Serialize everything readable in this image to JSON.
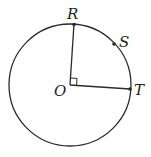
{
  "diagram": {
    "type": "circle-geometry",
    "colors": {
      "stroke": "#2a2a2a",
      "label": "#222222"
    },
    "circle": {
      "cx": 70,
      "cy": 85,
      "r": 61
    },
    "points": {
      "O": {
        "label": "O",
        "x": 70,
        "y": 85
      },
      "R": {
        "label": "R",
        "x": 74,
        "y": 24
      },
      "S": {
        "label": "S",
        "x": 114,
        "y": 44
      },
      "T": {
        "label": "T",
        "x": 130,
        "y": 89
      }
    },
    "segments": [
      "OR",
      "OT"
    ],
    "right_angle_at": "O"
  }
}
